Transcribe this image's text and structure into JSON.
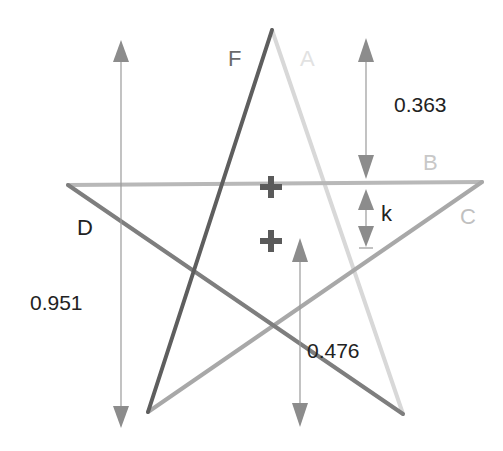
{
  "diagram": {
    "vertices": {
      "top": [
        272,
        30
      ],
      "left": [
        68,
        185
      ],
      "right": [
        482,
        182
      ],
      "bottom_left": [
        148,
        412
      ],
      "bottom_right": [
        403,
        414
      ]
    },
    "lines": [
      {
        "id": "A",
        "label": "A",
        "from": [
          68,
          185
        ],
        "to": [
          482,
          182
        ],
        "color": "#b8b8b8",
        "label_color": "#c8c8c8"
      },
      {
        "id": "B",
        "label": "B",
        "from": [
          482,
          182
        ],
        "to": [
          148,
          412
        ],
        "color": "#a8a8a8",
        "label_color": "#c0c0c0"
      },
      {
        "id": "C",
        "label": "C",
        "from": [
          68,
          185
        ],
        "to": [
          403,
          414
        ],
        "color": "#7e7e7e",
        "label_color": "#222222"
      },
      {
        "id": "D",
        "label": "D",
        "from": [
          272,
          30
        ],
        "to": [
          148,
          412
        ],
        "color": "#5e5e5e",
        "label_color": "#6a6a6a"
      },
      {
        "id": "F",
        "label": "F",
        "from": [
          272,
          30
        ],
        "to": [
          403,
          414
        ],
        "color": "#d8d8d8",
        "label_color": "#e2e2e2"
      }
    ],
    "measurements": [
      {
        "id": "height",
        "label": "0.951",
        "x": 121,
        "y1": 42,
        "y2": 425
      },
      {
        "id": "top-gap",
        "label": "0.363",
        "x": 366,
        "y1": 40,
        "y2": 178
      },
      {
        "id": "k-gap",
        "label": "k",
        "x": 366,
        "y1": 188,
        "y2": 248
      },
      {
        "id": "center-height",
        "label": "0.476",
        "x": 300,
        "y1": 238,
        "y2": 425
      }
    ],
    "markers": [
      {
        "id": "center-upper",
        "x": 271,
        "y": 187
      },
      {
        "id": "center-lower",
        "x": 271,
        "y": 241
      }
    ],
    "colors": {
      "arrow": "#8c8c8c",
      "marker": "#5a5a5a",
      "text": "#222222",
      "background": "#ffffff"
    }
  }
}
